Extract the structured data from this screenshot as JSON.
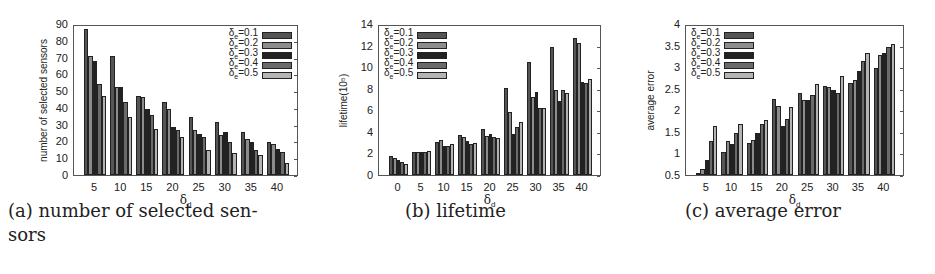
{
  "series_colors": [
    "#555555",
    "#8c8c8c",
    "#222222",
    "#6a6a6a",
    "#b4b4b4"
  ],
  "chart_data": [
    {
      "type": "bar",
      "title": "",
      "caption": "(a) number of selected sensors",
      "caption_lines": [
        "(a) number of selected sen-",
        "sors"
      ],
      "xlabel": "δd",
      "ylabel": "number of selected sensors",
      "ylim": [
        0,
        90
      ],
      "yticks": [
        "0",
        "10",
        "20",
        "30",
        "40",
        "50",
        "60",
        "70",
        "80",
        "90"
      ],
      "categories": [
        "5",
        "10",
        "15",
        "20",
        "25",
        "30",
        "35",
        "40"
      ],
      "legend_position": "upper right",
      "grid": false,
      "series": [
        {
          "name": "δe=0.1",
          "values": [
            88,
            72,
            48,
            44,
            35,
            32,
            26,
            20
          ]
        },
        {
          "name": "δe=0.2",
          "values": [
            72,
            53,
            47,
            40,
            27,
            24,
            22,
            19
          ]
        },
        {
          "name": "δe=0.3",
          "values": [
            69,
            53,
            40,
            29,
            25,
            26,
            20,
            16
          ]
        },
        {
          "name": "δe=0.4",
          "values": [
            55,
            44,
            36,
            27,
            23,
            20,
            15,
            14
          ]
        },
        {
          "name": "δe=0.5",
          "values": [
            48,
            35,
            28,
            23,
            15,
            13,
            12,
            7
          ]
        }
      ]
    },
    {
      "type": "bar",
      "title": "",
      "caption": "(b) lifetime",
      "caption_lines": [
        "(b) lifetime"
      ],
      "xlabel": "δd",
      "ylabel": "lifetime(10^5)",
      "ylim": [
        0,
        14
      ],
      "yticks": [
        "0",
        "2",
        "4",
        "6",
        "8",
        "10",
        "12",
        "14"
      ],
      "categories": [
        "0",
        "5",
        "10",
        "15",
        "20",
        "25",
        "30",
        "35",
        "40"
      ],
      "legend_position": "upper left",
      "grid": false,
      "series": [
        {
          "name": "δe=0.1",
          "values": [
            1.8,
            2.2,
            3.1,
            3.8,
            4.3,
            8.2,
            10.6,
            12.0,
            12.9
          ]
        },
        {
          "name": "δe=0.2",
          "values": [
            1.6,
            2.2,
            3.3,
            3.6,
            3.7,
            5.9,
            7.3,
            8.0,
            12.4
          ]
        },
        {
          "name": "δe=0.3",
          "values": [
            1.4,
            2.2,
            2.7,
            3.2,
            3.9,
            3.9,
            7.8,
            7.0,
            8.7
          ]
        },
        {
          "name": "δe=0.4",
          "values": [
            1.2,
            2.2,
            2.7,
            2.9,
            3.6,
            4.5,
            6.3,
            8.0,
            8.6
          ]
        },
        {
          "name": "δe=0.5",
          "values": [
            1.0,
            2.3,
            2.9,
            3.0,
            3.5,
            5.0,
            6.3,
            7.7,
            9.0
          ]
        }
      ]
    },
    {
      "type": "bar",
      "title": "",
      "caption": "(c) average error",
      "caption_lines": [
        "(c) average error"
      ],
      "xlabel": "δd",
      "ylabel": "average error",
      "ylim": [
        0.5,
        4
      ],
      "yticks": [
        "0.5",
        "1",
        "1.5",
        "2",
        "2.5",
        "3",
        "3.5",
        "4"
      ],
      "categories": [
        "5",
        "10",
        "15",
        "20",
        "25",
        "30",
        "35",
        "40"
      ],
      "legend_position": "upper left",
      "grid": false,
      "series": [
        {
          "name": "δe=0.1",
          "values": [
            0.52,
            1.04,
            1.25,
            2.28,
            2.42,
            2.58,
            2.67,
            3.02
          ]
        },
        {
          "name": "δe=0.2",
          "values": [
            0.65,
            1.31,
            1.32,
            2.11,
            2.26,
            2.56,
            2.73,
            3.32
          ]
        },
        {
          "name": "δe=0.3",
          "values": [
            0.86,
            1.23,
            1.48,
            1.66,
            2.27,
            2.49,
            2.95,
            3.36
          ]
        },
        {
          "name": "δe=0.4",
          "values": [
            1.3,
            1.49,
            1.69,
            1.81,
            2.39,
            2.43,
            3.18,
            3.5
          ]
        },
        {
          "name": "δe=0.5",
          "values": [
            1.65,
            1.71,
            1.8,
            2.09,
            2.63,
            2.82,
            3.36,
            3.58
          ]
        }
      ]
    }
  ]
}
